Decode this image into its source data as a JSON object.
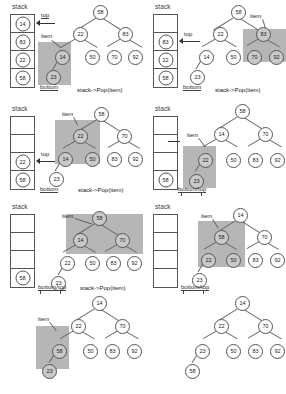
{
  "figure": {
    "highlight_color": "#b6b6b6",
    "node_fill": "#ffffff",
    "node_highlight_fill": "#c9c9c9",
    "labels": {
      "stack": "stack",
      "top": "top",
      "bottom": "bottom",
      "item": "item",
      "bottom_top": "bottom/top",
      "pop": "stack->Pop(item)"
    }
  },
  "panels": [
    {
      "id": "panel-1",
      "stack_title": "stack",
      "stack_cells": [
        "14",
        "83",
        "22",
        "58"
      ],
      "pointer_top_label": "top",
      "pointer_top_cell": 0,
      "pointer_bottom_label": "bottom",
      "item_label": "item",
      "caption": "stack->Pop(item)",
      "tree": {
        "root": "58",
        "nodes": [
          "58",
          "22",
          "83",
          "14",
          "50",
          "70",
          "92",
          "23"
        ],
        "highlighted": [
          "14",
          "23"
        ]
      }
    },
    {
      "id": "panel-2",
      "stack_title": "stack",
      "stack_cells": [
        "",
        "83",
        "22",
        "58"
      ],
      "pointer_top_label": "top",
      "pointer_top_cell": 1,
      "pointer_bottom_label": "bottom",
      "item_label": "item",
      "caption": "stack->Pop(item)",
      "tree": {
        "root": "58",
        "nodes": [
          "58",
          "22",
          "83",
          "14",
          "50",
          "70",
          "92",
          "23"
        ],
        "highlighted": [
          "83",
          "70",
          "92"
        ]
      }
    },
    {
      "id": "panel-3",
      "stack_title": "stack",
      "stack_cells": [
        "",
        "",
        "22",
        "58"
      ],
      "pointer_top_label": "top",
      "pointer_top_cell": 2,
      "pointer_bottom_label": "bottom",
      "item_label": "item",
      "caption": "stack->Pop(item)",
      "tree": {
        "root": "58",
        "nodes": [
          "58",
          "22",
          "70",
          "14",
          "50",
          "83",
          "92",
          "23"
        ],
        "highlighted": [
          "22",
          "14",
          "50"
        ]
      }
    },
    {
      "id": "panel-4",
      "stack_title": "stack",
      "stack_cells": [
        "",
        "",
        "",
        "58"
      ],
      "pointer_top_label": "top",
      "pointer_top_cell": 1,
      "pointer_bottom_label": "bottom/top",
      "item_label": "item",
      "caption": "",
      "tree": {
        "root": "58",
        "nodes": [
          "58",
          "14",
          "70",
          "22",
          "50",
          "83",
          "92",
          "23"
        ],
        "highlighted": [
          "22",
          "23"
        ]
      }
    },
    {
      "id": "panel-5",
      "stack_title": "stack",
      "stack_cells": [
        "",
        "",
        "",
        "58"
      ],
      "pointer_bottom_label": "bottom/top",
      "item_label": "item",
      "caption": "stack->Pop(item)",
      "tree": {
        "root": "58",
        "nodes": [
          "58",
          "14",
          "70",
          "22",
          "50",
          "83",
          "92",
          "23"
        ],
        "highlighted": [
          "58",
          "14",
          "70"
        ]
      }
    },
    {
      "id": "panel-6",
      "stack_title": "stack",
      "stack_cells": [
        "",
        "",
        "",
        ""
      ],
      "pointer_bottom_label": "bottom/top",
      "item_label": "item",
      "caption": "",
      "tree": {
        "root": "14",
        "nodes": [
          "14",
          "58",
          "70",
          "22",
          "50",
          "83",
          "92",
          "23"
        ],
        "highlighted": [
          "58",
          "22",
          "50"
        ]
      }
    },
    {
      "id": "panel-7",
      "item_label": "item",
      "caption": "",
      "tree": {
        "root": "14",
        "nodes": [
          "14",
          "22",
          "70",
          "58",
          "50",
          "83",
          "92",
          "23"
        ],
        "highlighted": [
          "58",
          "23"
        ]
      }
    },
    {
      "id": "panel-8",
      "caption": "",
      "tree": {
        "root": "14",
        "nodes": [
          "14",
          "22",
          "70",
          "23",
          "50",
          "83",
          "92",
          "58"
        ],
        "highlighted": []
      }
    }
  ]
}
